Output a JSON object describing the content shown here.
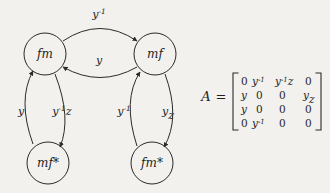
{
  "figure": {
    "background_color": "#f2f1ee",
    "stroke_color": "#2a2a2a"
  },
  "graph": {
    "nodes": [
      {
        "id": "fm",
        "label": "fm",
        "cx": 45,
        "cy": 54,
        "r": 21
      },
      {
        "id": "mf",
        "label": "mf",
        "cx": 155,
        "cy": 54,
        "r": 21
      },
      {
        "id": "mfs",
        "label": "mf*",
        "cx": 48,
        "cy": 163,
        "r": 21
      },
      {
        "id": "fms",
        "label": "fm*",
        "cx": 152,
        "cy": 163,
        "r": 21
      }
    ],
    "edges": [
      {
        "id": "fm-to-mf",
        "from": "fm",
        "to": "mf",
        "label": "y",
        "exponent": "-1",
        "suffix": "",
        "label_x": 99,
        "label_y": 18
      },
      {
        "id": "mf-to-fm",
        "from": "mf",
        "to": "fm",
        "label": "y",
        "exponent": "",
        "suffix": "",
        "label_x": 99,
        "label_y": 64
      },
      {
        "id": "mfs-to-fm",
        "from": "mfs",
        "to": "fm",
        "label": "y",
        "exponent": "",
        "suffix": "",
        "label_x": 21,
        "label_y": 115
      },
      {
        "id": "fm-to-mfs",
        "from": "fm",
        "to": "mfs",
        "label": "y",
        "exponent": "-1",
        "suffix": "z",
        "label_x": 62,
        "label_y": 115
      },
      {
        "id": "fms-to-mf",
        "from": "fms",
        "to": "mf",
        "label": "y",
        "exponent": "-1",
        "suffix": "",
        "label_x": 124,
        "label_y": 115
      },
      {
        "id": "mf-to-fms",
        "from": "mf",
        "to": "fms",
        "label": "y",
        "exponent": "",
        "suffix": "z",
        "label_x": 168,
        "label_y": 115
      }
    ]
  },
  "matrix": {
    "name": "A",
    "equals": "=",
    "rows": [
      [
        {
          "base": "0",
          "exponent": "",
          "suffix": "",
          "numeric": true
        },
        {
          "base": "y",
          "exponent": "-1",
          "suffix": "",
          "numeric": false
        },
        {
          "base": "y",
          "exponent": "-1",
          "suffix": "z",
          "numeric": false
        },
        {
          "base": "0",
          "exponent": "",
          "suffix": "",
          "numeric": true
        }
      ],
      [
        {
          "base": "y",
          "exponent": "",
          "suffix": "",
          "numeric": false
        },
        {
          "base": "0",
          "exponent": "",
          "suffix": "",
          "numeric": true
        },
        {
          "base": "0",
          "exponent": "",
          "suffix": "",
          "numeric": true
        },
        {
          "base": "y",
          "exponent": "",
          "suffix": "z",
          "numeric": false
        }
      ],
      [
        {
          "base": "y",
          "exponent": "",
          "suffix": "",
          "numeric": false
        },
        {
          "base": "0",
          "exponent": "",
          "suffix": "",
          "numeric": true
        },
        {
          "base": "0",
          "exponent": "",
          "suffix": "",
          "numeric": true
        },
        {
          "base": "0",
          "exponent": "",
          "suffix": "",
          "numeric": true
        }
      ],
      [
        {
          "base": "0",
          "exponent": "",
          "suffix": "",
          "numeric": true
        },
        {
          "base": "y",
          "exponent": "-1",
          "suffix": "",
          "numeric": false
        },
        {
          "base": "0",
          "exponent": "",
          "suffix": "",
          "numeric": true
        },
        {
          "base": "0",
          "exponent": "",
          "suffix": "",
          "numeric": true
        }
      ]
    ]
  }
}
